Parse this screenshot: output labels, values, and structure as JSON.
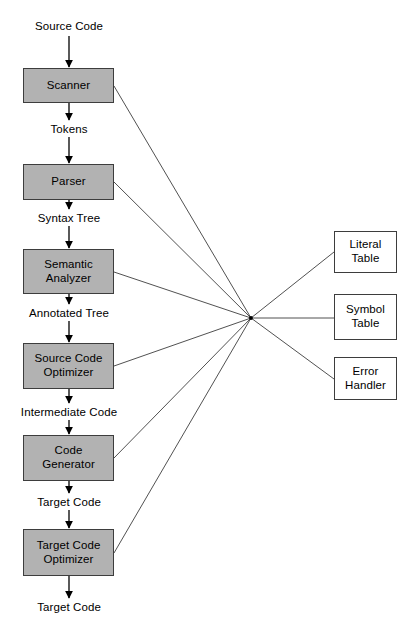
{
  "diagram": {
    "colors": {
      "phase_fill": "#b2b2b2",
      "aux_fill": "#ffffff",
      "stroke": "#3d3d3d",
      "background": "#ffffff",
      "text": "#000000"
    },
    "hub": {
      "x": 251,
      "y": 318
    },
    "phases": [
      {
        "id": "scanner",
        "label": "Scanner",
        "x": 23,
        "y": 68,
        "w": 91,
        "h": 35
      },
      {
        "id": "parser",
        "label": "Parser",
        "x": 23,
        "y": 164,
        "w": 91,
        "h": 36
      },
      {
        "id": "semantic-analyzer",
        "label": "Semantic\nAnalyzer",
        "x": 23,
        "y": 249,
        "w": 91,
        "h": 45
      },
      {
        "id": "source-code-optimizer",
        "label": "Source Code\nOptimizer",
        "x": 23,
        "y": 343,
        "w": 91,
        "h": 46
      },
      {
        "id": "code-generator",
        "label": "Code\nGenerator",
        "x": 23,
        "y": 435,
        "w": 91,
        "h": 46
      },
      {
        "id": "target-code-optimizer",
        "label": "Target Code\nOptimizer",
        "x": 23,
        "y": 529,
        "w": 91,
        "h": 47
      }
    ],
    "auxiliaries": [
      {
        "id": "literal-table",
        "label": "Literal\nTable",
        "x": 334,
        "y": 231,
        "w": 63,
        "h": 42
      },
      {
        "id": "symbol-table",
        "label": "Symbol\nTable",
        "x": 334,
        "y": 294,
        "w": 63,
        "h": 46
      },
      {
        "id": "error-handler",
        "label": "Error\nHandler",
        "x": 334,
        "y": 357,
        "w": 63,
        "h": 43
      }
    ],
    "flow_labels": [
      {
        "id": "source-code-in",
        "text": "Source Code",
        "x": 69,
        "y": 20
      },
      {
        "id": "tokens",
        "text": "Tokens",
        "x": 69,
        "y": 123
      },
      {
        "id": "syntax-tree",
        "text": "Syntax Tree",
        "x": 69,
        "y": 212
      },
      {
        "id": "annotated-tree",
        "text": "Annotated Tree",
        "x": 69,
        "y": 307
      },
      {
        "id": "intermediate-code",
        "text": "Intermediate Code",
        "x": 69,
        "y": 406
      },
      {
        "id": "target-code-mid",
        "text": "Target Code",
        "x": 69,
        "y": 496
      },
      {
        "id": "target-code-out",
        "text": "Target Code",
        "x": 69,
        "y": 601
      }
    ],
    "vertical_arrows": [
      {
        "id": "arrow-into-scanner",
        "x": 69,
        "y1": 36,
        "y2": 67
      },
      {
        "id": "arrow-scanner-to-tokens",
        "x": 69,
        "y1": 103,
        "y2": 120
      },
      {
        "id": "arrow-tokens-to-parser",
        "x": 69,
        "y1": 137,
        "y2": 163
      },
      {
        "id": "arrow-parser-to-syntaxtree",
        "x": 69,
        "y1": 200,
        "y2": 209
      },
      {
        "id": "arrow-syntaxtree-to-semantic",
        "x": 69,
        "y1": 226,
        "y2": 248
      },
      {
        "id": "arrow-semantic-to-annotated",
        "x": 69,
        "y1": 294,
        "y2": 304
      },
      {
        "id": "arrow-annotated-to-sourceopt",
        "x": 69,
        "y1": 321,
        "y2": 342
      },
      {
        "id": "arrow-sourceopt-to-intermediate",
        "x": 69,
        "y1": 389,
        "y2": 403
      },
      {
        "id": "arrow-intermediate-to-codegen",
        "x": 69,
        "y1": 420,
        "y2": 434
      },
      {
        "id": "arrow-codegen-to-targetcode",
        "x": 69,
        "y1": 481,
        "y2": 493
      },
      {
        "id": "arrow-targetcode-to-targetopt",
        "x": 69,
        "y1": 510,
        "y2": 528
      },
      {
        "id": "arrow-targetopt-to-output",
        "x": 69,
        "y1": 576,
        "y2": 598
      }
    ],
    "hub_links_left": [
      {
        "id": "link-scanner-hub",
        "x1": 114,
        "y1": 86,
        "x2": 251,
        "y2": 318
      },
      {
        "id": "link-parser-hub",
        "x1": 114,
        "y1": 182,
        "x2": 251,
        "y2": 318
      },
      {
        "id": "link-semantic-hub",
        "x1": 114,
        "y1": 272,
        "x2": 251,
        "y2": 318
      },
      {
        "id": "link-source-code-optimizer-hub",
        "x1": 114,
        "y1": 366,
        "x2": 251,
        "y2": 318
      },
      {
        "id": "link-code-generator-hub",
        "x1": 114,
        "y1": 458,
        "x2": 251,
        "y2": 318
      },
      {
        "id": "link-target-code-optimizer-hub",
        "x1": 114,
        "y1": 553,
        "x2": 251,
        "y2": 318
      }
    ],
    "hub_links_right": [
      {
        "id": "link-hub-literal-table",
        "x1": 251,
        "y1": 318,
        "x2": 334,
        "y2": 252
      },
      {
        "id": "link-hub-symbol-table",
        "x1": 251,
        "y1": 318,
        "x2": 334,
        "y2": 318
      },
      {
        "id": "link-hub-error-handler",
        "x1": 251,
        "y1": 318,
        "x2": 334,
        "y2": 379
      }
    ]
  }
}
